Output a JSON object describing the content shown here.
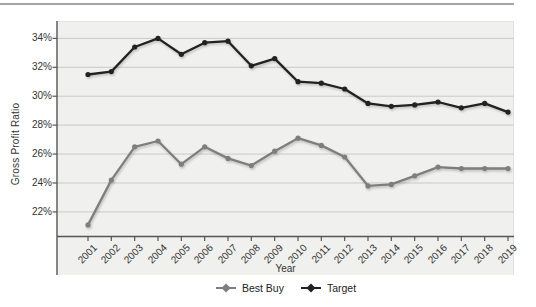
{
  "chart_data": {
    "type": "line",
    "title": "",
    "xlabel": "Year",
    "ylabel": "Gross Profit Ratio",
    "categories": [
      "2001",
      "2002",
      "2003",
      "2004",
      "2005",
      "2006",
      "2007",
      "2008",
      "2009",
      "2010",
      "2011",
      "2012",
      "2013",
      "2014",
      "2015",
      "2016",
      "2017",
      "2018",
      "2019"
    ],
    "series": [
      {
        "name": "Best Buy",
        "color": "#7e7e7e",
        "values": [
          21.1,
          24.2,
          26.5,
          26.9,
          25.3,
          26.5,
          25.7,
          25.2,
          26.2,
          27.1,
          26.6,
          25.8,
          23.8,
          23.9,
          24.5,
          25.1,
          25.0,
          25.0,
          25.0
        ]
      },
      {
        "name": "Target",
        "color": "#222222",
        "values": [
          31.5,
          31.7,
          33.4,
          34.0,
          32.9,
          33.7,
          33.8,
          32.1,
          32.6,
          31.0,
          30.9,
          30.5,
          29.5,
          29.3,
          29.4,
          29.6,
          29.2,
          29.5,
          28.9
        ]
      }
    ],
    "ylim": [
      20.3,
      35.2
    ],
    "yticks": [
      34,
      32,
      30,
      28,
      26,
      24,
      22
    ],
    "ytick_suffix": "%",
    "grid": "horizontal-only",
    "legend_position": "bottom-center",
    "plot_background": "#f0f0ee",
    "gridline_color": "#c9c9c9",
    "axis_color": "#555555",
    "tick_text_color": "#333333"
  }
}
